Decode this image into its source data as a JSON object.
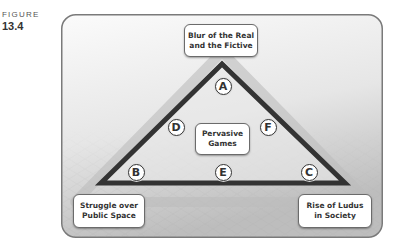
{
  "figure": {
    "label": "FIGURE",
    "number": "13.4"
  },
  "diagram": {
    "top_box": "Blur of the Real\nand the Fictive",
    "center_box": "Pervasive\nGames",
    "bottom_left_box": "Struggle over\nPublic Space",
    "bottom_right_box": "Rise of Ludus\nin Society",
    "nodes": {
      "A": "A",
      "B": "B",
      "C": "C",
      "D": "D",
      "E": "E",
      "F": "F"
    },
    "colors": {
      "triangle_stroke": "#333333",
      "panel_border": "#7a7a7a",
      "panel_fill_top": "#f6f6f6",
      "panel_fill_bottom": "#c4c4c4"
    }
  }
}
